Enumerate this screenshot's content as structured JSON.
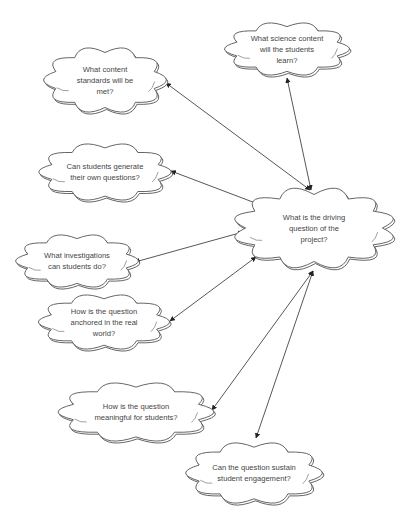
{
  "diagram": {
    "type": "concept-map",
    "center": {
      "id": "driving-question",
      "label": "What is the driving\nquestion of the\nproject?",
      "x": 314,
      "y": 228,
      "w": 152,
      "h": 78
    },
    "nodes": [
      {
        "id": "science-content",
        "label": "What science content\nwill the students\nlearn?",
        "x": 287,
        "y": 49,
        "w": 117,
        "h": 52
      },
      {
        "id": "content-standards",
        "label": "What content\nstandards will be\nmet?",
        "x": 105,
        "y": 80,
        "w": 115,
        "h": 64
      },
      {
        "id": "own-questions",
        "label": "Can students generate\ntheir own questions?",
        "x": 105,
        "y": 172,
        "w": 124,
        "h": 56
      },
      {
        "id": "investigations",
        "label": "What investigations\ncan students do?",
        "x": 77,
        "y": 261,
        "w": 115,
        "h": 52
      },
      {
        "id": "anchored",
        "label": "How is the question\nanchored in the real\nworld?",
        "x": 104,
        "y": 322,
        "w": 123,
        "h": 54
      },
      {
        "id": "meaningful",
        "label": "How is the question\nmeaningful for students?",
        "x": 136,
        "y": 412,
        "w": 146,
        "h": 58
      },
      {
        "id": "engagement",
        "label": "Can the question sustain\nstudent engagement?",
        "x": 254,
        "y": 473,
        "w": 128,
        "h": 60
      }
    ],
    "edges": [
      {
        "from": "driving-question",
        "to": "science-content",
        "x1": 311,
        "y1": 190,
        "x2": 287,
        "y2": 78,
        "bidirectional": true
      },
      {
        "from": "driving-question",
        "to": "content-standards",
        "x1": 310,
        "y1": 190,
        "x2": 166,
        "y2": 83,
        "bidirectional": true
      },
      {
        "from": "driving-question",
        "to": "own-questions",
        "x1": 258,
        "y1": 204,
        "x2": 171,
        "y2": 171,
        "bidirectional": true
      },
      {
        "from": "driving-question",
        "to": "investigations",
        "x1": 243,
        "y1": 232,
        "x2": 135,
        "y2": 262,
        "bidirectional": true
      },
      {
        "from": "driving-question",
        "to": "anchored",
        "x1": 256,
        "y1": 257,
        "x2": 170,
        "y2": 321,
        "bidirectional": true
      },
      {
        "from": "driving-question",
        "to": "meaningful",
        "x1": 313,
        "y1": 271,
        "x2": 212,
        "y2": 410,
        "bidirectional": true
      },
      {
        "from": "driving-question",
        "to": "engagement",
        "x1": 313,
        "y1": 271,
        "x2": 256,
        "y2": 438,
        "bidirectional": true
      }
    ],
    "colors": {
      "stroke": "#555555",
      "text": "#444444",
      "background": "#ffffff"
    }
  }
}
